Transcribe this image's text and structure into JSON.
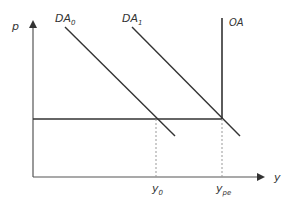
{
  "diagram": {
    "type": "economics-supply-demand",
    "axes": {
      "y_label": "p",
      "x_label": "y"
    },
    "curves": [
      {
        "name": "DA",
        "subscript": "0",
        "kind": "demand"
      },
      {
        "name": "DA",
        "subscript": "1",
        "kind": "demand"
      },
      {
        "name": "OA",
        "subscript": "",
        "kind": "vertical-supply"
      }
    ],
    "x_ticks": [
      {
        "main": "y",
        "subscript": "0"
      },
      {
        "main": "y",
        "subscript": "pe"
      }
    ],
    "colors": {
      "line": "#333333",
      "axis": "#555555",
      "dashed": "#999999"
    }
  }
}
